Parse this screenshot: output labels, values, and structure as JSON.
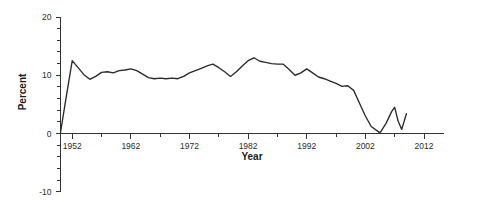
{
  "chart_data": {
    "type": "line",
    "title": "",
    "xlabel": "Year",
    "ylabel": "Percent",
    "xlim": [
      1950,
      2012
    ],
    "ylim": [
      -10,
      20
    ],
    "grid": false,
    "legend": "none",
    "line_color": "#2a2a2a",
    "x_major_ticks": [
      1952,
      1962,
      1972,
      1982,
      1992,
      2002,
      2012
    ],
    "x_major_tick_labels": [
      "1952",
      "1962",
      "1972",
      "1982",
      "1992",
      "2002",
      "2012"
    ],
    "x_minor_ticks": [
      1957,
      1967,
      1977,
      1987,
      1997,
      2007
    ],
    "y_major_ticks": [
      -10,
      0,
      10,
      20
    ],
    "y_major_tick_labels": [
      "-10",
      "0",
      "10",
      "20"
    ],
    "y_minor_ticks": [
      -8,
      -6,
      -4,
      -2,
      2,
      4,
      6,
      8,
      12,
      14,
      16,
      18
    ],
    "series": [
      {
        "name": "Percent",
        "x": [
          1950,
          1951,
          1952,
          1953,
          1954,
          1955,
          1956,
          1957,
          1958,
          1959,
          1960,
          1961,
          1962,
          1963,
          1964,
          1965,
          1966,
          1967,
          1968,
          1969,
          1970,
          1971,
          1972,
          1973,
          1974,
          1975,
          1976,
          1977,
          1978,
          1979,
          1980,
          1981,
          1982,
          1983,
          1984,
          1985,
          1986,
          1987,
          1988,
          1989,
          1990,
          1991,
          1992,
          1993,
          1994,
          1995,
          1996,
          1997,
          1998,
          1999,
          2000,
          2001,
          2002,
          2003,
          2004,
          2005,
          2006,
          2007,
          2008,
          2009
        ],
        "values": [
          0.2,
          6.4,
          12.5,
          11.3,
          10.1,
          9.3,
          9.8,
          10.5,
          10.6,
          10.4,
          10.8,
          10.9,
          11.1,
          10.8,
          10.2,
          9.6,
          9.4,
          9.5,
          9.4,
          9.5,
          9.4,
          9.8,
          10.4,
          10.8,
          11.2,
          11.6,
          11.9,
          11.3,
          10.6,
          9.8,
          10.6,
          11.6,
          12.5,
          13.0,
          12.4,
          12.2,
          12.0,
          11.9,
          11.9,
          11.0,
          10.0,
          10.4,
          11.1,
          10.4,
          9.7,
          9.4,
          9.0,
          8.6,
          8.1,
          8.2,
          7.4,
          5.2,
          3.0,
          1.2,
          0.1,
          0.4,
          1.6,
          1.8,
          2.2,
          3.4
        ],
        "extra_x": [
          2004.5,
          2005.5,
          2006.5,
          2007.0,
          2007.6,
          2008.2,
          2009.0
        ],
        "extra_values": [
          0.1,
          1.7,
          3.8,
          4.5,
          2.1,
          0.7,
          3.4
        ]
      }
    ],
    "annotations": []
  },
  "axis": {
    "y_title": "Percent",
    "x_title": "Year"
  }
}
